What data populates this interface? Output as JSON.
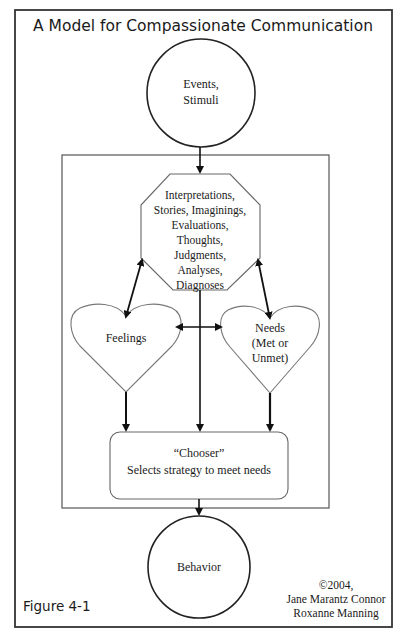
{
  "diagram": {
    "title": "A Model for Compassionate Communication",
    "nodes": {
      "events": {
        "lines": [
          "Events,",
          "Stimuli"
        ]
      },
      "interpretations": {
        "lines": [
          "Interpretations,",
          "Stories, Imaginings,",
          "Evaluations,",
          "Thoughts,",
          "Judgments,",
          "Analyses,",
          "Diagnoses"
        ]
      },
      "feelings": {
        "lines": [
          "Feelings"
        ]
      },
      "needs": {
        "lines": [
          "Needs",
          "(Met or",
          "Unmet)"
        ]
      },
      "chooser": {
        "lines": [
          "“Chooser”",
          "Selects strategy to meet needs"
        ]
      },
      "behavior": {
        "lines": [
          "Behavior"
        ]
      }
    },
    "edges": [
      {
        "from": "events",
        "to": "interpretations",
        "type": "arrow"
      },
      {
        "from": "interpretations",
        "to": "feelings",
        "type": "double-arrow"
      },
      {
        "from": "interpretations",
        "to": "needs",
        "type": "double-arrow"
      },
      {
        "from": "feelings",
        "to": "needs",
        "type": "double-arrow"
      },
      {
        "from": "interpretations",
        "to": "chooser",
        "type": "arrow"
      },
      {
        "from": "feelings",
        "to": "chooser",
        "type": "arrow"
      },
      {
        "from": "needs",
        "to": "chooser",
        "type": "arrow"
      },
      {
        "from": "chooser",
        "to": "behavior",
        "type": "arrow"
      }
    ],
    "figure_label": "Figure 4-1",
    "copyright": {
      "lines": [
        "©2004,",
        "Jane Marantz Connor",
        "Roxanne Manning"
      ]
    }
  }
}
